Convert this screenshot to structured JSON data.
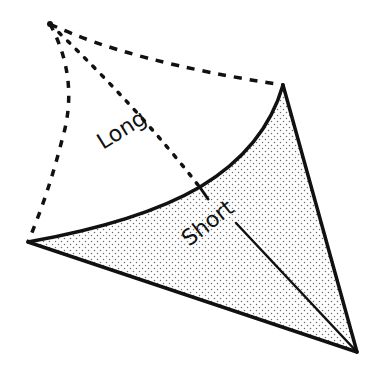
{
  "diagram": {
    "labels": {
      "long": "Long",
      "short": "Short"
    },
    "colors": {
      "stroke": "#111111",
      "stipple": "#6b6b6b",
      "fill_background": "#ffffff"
    },
    "points": {
      "apex": [
        50,
        24
      ],
      "right_vertex": [
        283,
        85
      ],
      "left_vertex": [
        28,
        242
      ],
      "bottom_vertex": [
        357,
        352
      ],
      "tick_point": [
        200,
        187
      ]
    }
  }
}
